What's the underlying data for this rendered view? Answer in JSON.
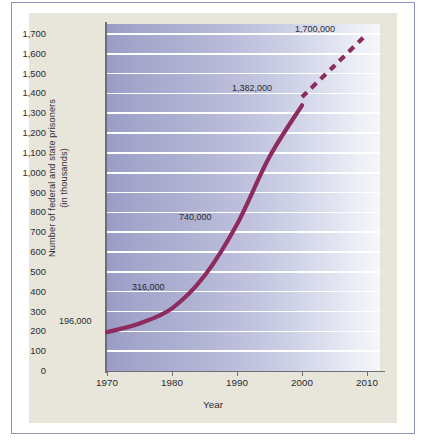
{
  "figure": {
    "y_axis_title_line1": "Number of federal and state prisoners",
    "y_axis_title_line2": "(in thousands)",
    "x_axis_title": "Year"
  },
  "chart_data": {
    "type": "line",
    "title": "",
    "subtitle": "",
    "xlabel": "Year",
    "ylabel": "Number of federal and state prisoners (in thousands)",
    "xlim": [
      1970,
      2012
    ],
    "ylim": [
      0,
      1750
    ],
    "grid": true,
    "legend": "none",
    "x_ticks": [
      "1970",
      "1980",
      "1990",
      "2000",
      "2010"
    ],
    "x_tick_values": [
      1970,
      1980,
      1990,
      2000,
      2010
    ],
    "y_ticks": [
      "0",
      "100",
      "200",
      "300",
      "400",
      "500",
      "600",
      "700",
      "800",
      "900",
      "1,000",
      "1,100",
      "1,200",
      "1,300",
      "1,400",
      "1,500",
      "1,600",
      "1,700"
    ],
    "y_tick_values": [
      0,
      100,
      200,
      300,
      400,
      500,
      600,
      700,
      800,
      900,
      1000,
      1100,
      1200,
      1300,
      1400,
      1500,
      1600,
      1700
    ],
    "series": [
      {
        "name": "Actual (solid)",
        "style": "solid",
        "color": "#8e2b5e",
        "x": [
          1970,
          1975,
          1980,
          1985,
          1990,
          1995,
          2000
        ],
        "values": [
          196,
          240,
          316,
          480,
          740,
          1080,
          1340
        ]
      },
      {
        "name": "Projected (dashed)",
        "style": "dashed",
        "color": "#8e2b5e",
        "x": [
          2000,
          2005,
          2010
        ],
        "values": [
          1382,
          1540,
          1700
        ]
      }
    ],
    "annotations": [
      {
        "text": "196,000",
        "x": 1970,
        "y": 196
      },
      {
        "text": "316,000",
        "x": 1980,
        "y": 316
      },
      {
        "text": "740,000",
        "x": 1990,
        "y": 740
      },
      {
        "text": "1,382,000",
        "x": 2000,
        "y": 1382
      },
      {
        "text": "1,700,000",
        "x": 2010,
        "y": 1700
      }
    ],
    "colors": {
      "line": "#8e2b5e",
      "plot_bg_left": "#9a9cc6",
      "plot_bg_right": "#f6f7fb",
      "gridline": "#ffffff",
      "panel_bg": "#e8e5da",
      "frame_border": "#8b92b8"
    }
  }
}
